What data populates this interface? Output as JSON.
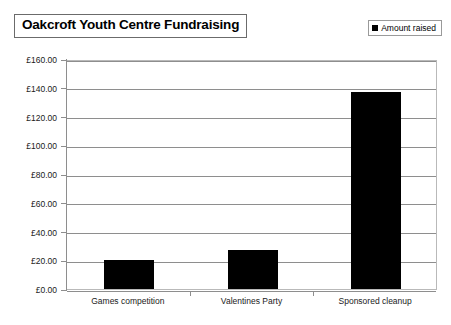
{
  "chart_data": {
    "type": "bar",
    "title": "Oakcroft Youth Centre Fundraising",
    "xlabel": "",
    "ylabel": "",
    "categories": [
      "Games competition",
      "Valentines Party",
      "Sponsored cleanup"
    ],
    "series": [
      {
        "name": "Amount raised",
        "values": [
          20.0,
          27.0,
          137.0
        ],
        "color": "#000000"
      }
    ],
    "ylim": [
      0,
      160
    ],
    "ytick_step": 20,
    "ytick_labels": [
      "£0.00",
      "£20.00",
      "£40.00",
      "£60.00",
      "£80.00",
      "£100.00",
      "£120.00",
      "£140.00",
      "£160.00"
    ],
    "ytick_values": [
      0,
      20,
      40,
      60,
      80,
      100,
      120,
      140,
      160
    ],
    "grid": true,
    "grid_axis": "y",
    "legend": {
      "position": "top-right",
      "entries": [
        "Amount raised"
      ]
    },
    "currency_symbol": "£",
    "plot_background": "#ffffff",
    "grid_color": "#8e8e8e",
    "border_color": "#b9b9b9"
  }
}
